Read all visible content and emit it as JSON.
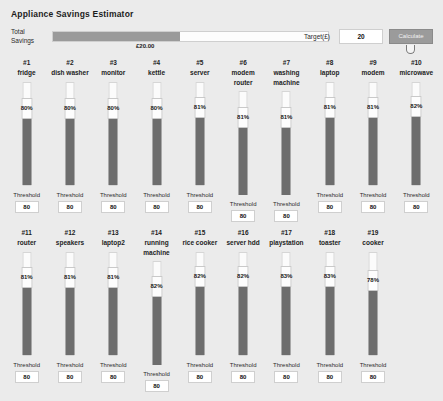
{
  "header": {
    "app_title": "Appliance Savings Estimator",
    "savings_label": "Total Savings",
    "savings_amount": "£20.00",
    "savings_fill_percent": 46,
    "target_label": "Target(£)",
    "target_value": "20",
    "calculate_label": "Calculate"
  },
  "labels": {
    "threshold": "Threshold"
  },
  "appliances": [
    {
      "index": "#1",
      "name": "fridge",
      "percent": "80%",
      "value": 80,
      "threshold": "80"
    },
    {
      "index": "#2",
      "name": "dish washer",
      "percent": "80%",
      "value": 80,
      "threshold": "80"
    },
    {
      "index": "#3",
      "name": "monitor",
      "percent": "80%",
      "value": 80,
      "threshold": "80"
    },
    {
      "index": "#4",
      "name": "kettle",
      "percent": "80%",
      "value": 80,
      "threshold": "80"
    },
    {
      "index": "#5",
      "name": "server",
      "percent": "81%",
      "value": 81,
      "threshold": "80"
    },
    {
      "index": "#6",
      "name": "modem router",
      "percent": "81%",
      "value": 81,
      "threshold": "80"
    },
    {
      "index": "#7",
      "name": "washing machine",
      "percent": "81%",
      "value": 81,
      "threshold": "80"
    },
    {
      "index": "#8",
      "name": "laptop",
      "percent": "81%",
      "value": 81,
      "threshold": "80"
    },
    {
      "index": "#9",
      "name": "modem",
      "percent": "81%",
      "value": 81,
      "threshold": "80"
    },
    {
      "index": "#10",
      "name": "microwave",
      "percent": "82%",
      "value": 82,
      "threshold": "80"
    },
    {
      "index": "#11",
      "name": "router",
      "percent": "81%",
      "value": 81,
      "threshold": "80"
    },
    {
      "index": "#12",
      "name": "speakers",
      "percent": "81%",
      "value": 81,
      "threshold": "80"
    },
    {
      "index": "#13",
      "name": "laptop2",
      "percent": "81%",
      "value": 81,
      "threshold": "80"
    },
    {
      "index": "#14",
      "name": "running machine",
      "percent": "82%",
      "value": 82,
      "threshold": "80"
    },
    {
      "index": "#15",
      "name": "rice cooker",
      "percent": "82%",
      "value": 82,
      "threshold": "80"
    },
    {
      "index": "#16",
      "name": "server hdd",
      "percent": "82%",
      "value": 82,
      "threshold": "80"
    },
    {
      "index": "#17",
      "name": "playstation",
      "percent": "83%",
      "value": 83,
      "threshold": "80"
    },
    {
      "index": "#18",
      "name": "toaster",
      "percent": "83%",
      "value": 83,
      "threshold": "80"
    },
    {
      "index": "#19",
      "name": "cooker",
      "percent": "78%",
      "value": 78,
      "threshold": "80"
    }
  ]
}
